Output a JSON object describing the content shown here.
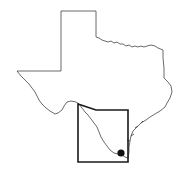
{
  "map": {
    "subject": "Texas state outline",
    "highlighted_region": "South Texas study area",
    "marker": {
      "type": "location-dot",
      "color": "#111111"
    },
    "colors": {
      "outline": "#444444",
      "region_box": "#1a1a1a",
      "background": "#ffffff"
    }
  }
}
